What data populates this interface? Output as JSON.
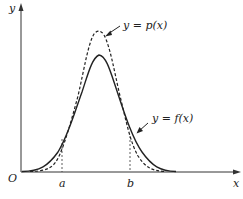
{
  "figure": {
    "axes": {
      "x_label": "x",
      "y_label": "y",
      "origin_label": "O"
    },
    "points": {
      "a_label": "a",
      "b_label": "b"
    },
    "curves": [
      {
        "name": "f",
        "label": "y = f(x)",
        "style": "solid"
      },
      {
        "name": "p",
        "label": "y = p(x)",
        "style": "dashed"
      }
    ],
    "colors": {
      "line": "#222222",
      "background": "#ffffff"
    }
  }
}
